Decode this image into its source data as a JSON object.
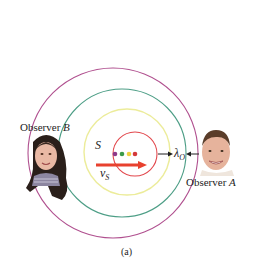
{
  "figure": {
    "caption": "(a)",
    "source_label": "S",
    "velocity_label": {
      "symbol": "v",
      "subscript": "S"
    },
    "wavelength_label": {
      "symbol": "λ",
      "subscript": "O"
    },
    "observer_a": {
      "prefix": "Observer ",
      "letter": "A"
    },
    "observer_b": {
      "prefix": "Observer ",
      "letter": "B"
    }
  },
  "wavefronts": [
    {
      "name": "purple",
      "color": "#b0508f",
      "cx": 113,
      "cy": 153,
      "r": 85
    },
    {
      "name": "green",
      "color": "#4d9e86",
      "cx": 122,
      "cy": 153,
      "r": 64
    },
    {
      "name": "yellow",
      "color": "#ecec9a",
      "cx": 127,
      "cy": 152,
      "r": 43
    },
    {
      "name": "red",
      "color": "#e2474c",
      "cx": 135,
      "cy": 154,
      "r": 22
    }
  ],
  "source_positions": [
    {
      "color": "#8e3a8a",
      "x": 115,
      "y": 154
    },
    {
      "color": "#3c9a4a",
      "x": 122,
      "y": 154
    },
    {
      "color": "#f0d040",
      "x": 129,
      "y": 154
    },
    {
      "color": "#d43a3a",
      "x": 135,
      "y": 154
    }
  ],
  "colors": {
    "velocity_arrow": "#e8412e",
    "wavelength_arrows": "#1e1e1e"
  }
}
